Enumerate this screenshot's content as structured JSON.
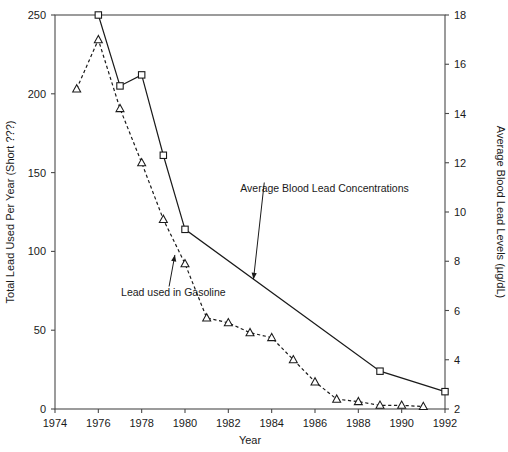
{
  "chart_data": {
    "type": "line",
    "title": "",
    "xlabel": "Year",
    "ylabel": "Total Lead Used Per Year (Short ???)",
    "y2label": "Average Blood Lead Levels (µg/dL)",
    "xlim": [
      1974,
      1992
    ],
    "ylim": [
      0,
      250
    ],
    "y2lim": [
      2,
      18
    ],
    "xticks": [
      1974,
      1976,
      1978,
      1980,
      1982,
      1984,
      1986,
      1988,
      1990,
      1992
    ],
    "xtick_labels": [
      "1974",
      "1976",
      "1978",
      "1980",
      "1982",
      "1984",
      "1986",
      "1988",
      "1990",
      "1992"
    ],
    "yticks": [
      0,
      50,
      100,
      150,
      200,
      250
    ],
    "ytick_labels": [
      "0",
      "50",
      "100",
      "150",
      "200",
      "250"
    ],
    "y2ticks": [
      2,
      4,
      6,
      8,
      10,
      12,
      14,
      16,
      18
    ],
    "y2tick_labels": [
      "2",
      "4",
      "6",
      "8",
      "10",
      "12",
      "14",
      "16",
      "18"
    ],
    "grid": false,
    "legend_position": "none",
    "series": [
      {
        "name": "Lead used in  Gasoline",
        "axis": "left",
        "style": "solid",
        "marker": "square",
        "x": [
          1976,
          1977,
          1978,
          1979,
          1980,
          1989,
          1992
        ],
        "values": [
          250,
          205,
          212,
          161,
          114,
          24,
          11
        ]
      },
      {
        "name": "Average Blood Lead Concentrations",
        "axis": "right",
        "style": "dashed",
        "marker": "triangle",
        "x": [
          1975,
          1976,
          1977,
          1978,
          1979,
          1980,
          1981,
          1982,
          1983,
          1984,
          1985,
          1986,
          1987,
          1988,
          1989,
          1990,
          1991
        ],
        "values": [
          15.0,
          17.0,
          14.2,
          12.0,
          9.7,
          7.9,
          5.7,
          5.5,
          5.1,
          4.9,
          4.0,
          3.1,
          2.4,
          2.3,
          2.15,
          2.15,
          2.1
        ]
      }
    ],
    "annotations": [
      {
        "name": "gasoline-annotation",
        "text": "Lead used in  Gasoline",
        "text_x": 1977.05,
        "text_y_left": 72,
        "arrow_to_x": 1979.55,
        "arrow_to_y_left": 99
      },
      {
        "name": "blood-lead-annotation",
        "text": "Average Blood Lead Concentrations",
        "text_x": 1982.55,
        "text_y_left": 138,
        "arrow_to_x": 1983.15,
        "arrow_to_y_left": 81
      }
    ],
    "colors": {
      "line": "#1a1a1a",
      "axis": "#4a4a4a",
      "background": "#ffffff",
      "marker_fill": "#ffffff"
    }
  }
}
